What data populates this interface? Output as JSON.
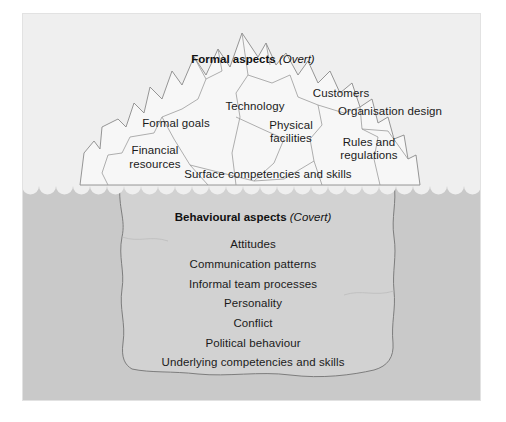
{
  "figure": {
    "type": "iceberg-diagram",
    "title_overt": {
      "bold": "Formal aspects",
      "italic": "(Overt)"
    },
    "title_covert": {
      "bold": "Behavioural aspects",
      "italic": "(Covert)"
    },
    "colors": {
      "page_background": "#ffffff",
      "panel_above_water": "#efefef",
      "panel_below_water": "#c9c9c9",
      "iceberg_above_fill": "#f7f7f7",
      "iceberg_below_fill": "#d2d2d2",
      "outline": "#8a8a8a",
      "text": "#1a1a1a",
      "waterline_foam": "#f2f2f2"
    },
    "overt_labels": [
      {
        "text": "Formal goals",
        "x": 176,
        "y": 117
      },
      {
        "text": "Technology",
        "x": 255,
        "y": 100
      },
      {
        "text": "Customers",
        "x": 341,
        "y": 87
      },
      {
        "text": "Organisation design",
        "x": 390,
        "y": 105
      },
      {
        "text": "Physical",
        "x": 291,
        "y": 119
      },
      {
        "text": "facilities",
        "x": 291,
        "y": 132
      },
      {
        "text": "Rules and",
        "x": 369,
        "y": 136
      },
      {
        "text": "regulations",
        "x": 369,
        "y": 149
      },
      {
        "text": "Financial",
        "x": 155,
        "y": 144
      },
      {
        "text": "resources",
        "x": 155,
        "y": 158
      },
      {
        "text": "Surface competencies and skills",
        "x": 268,
        "y": 168
      }
    ],
    "covert_labels": [
      {
        "text": "Attitudes",
        "x": 253,
        "y": 238
      },
      {
        "text": "Communication patterns",
        "x": 253,
        "y": 258
      },
      {
        "text": "Informal team processes",
        "x": 253,
        "y": 278
      },
      {
        "text": "Personality",
        "x": 253,
        "y": 297
      },
      {
        "text": "Conflict",
        "x": 253,
        "y": 317
      },
      {
        "text": "Political behaviour",
        "x": 253,
        "y": 337
      },
      {
        "text": "Underlying competencies and skills",
        "x": 253,
        "y": 356
      }
    ],
    "header_overt_pos": {
      "x": 253,
      "y": 52
    },
    "header_covert_pos": {
      "x": 253,
      "y": 210
    },
    "waterline_y": 186,
    "panel": {
      "x": 22,
      "y": 13,
      "w": 459,
      "h": 388
    }
  }
}
